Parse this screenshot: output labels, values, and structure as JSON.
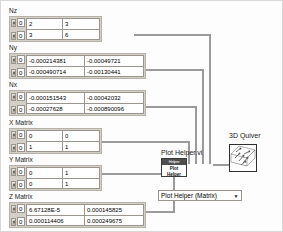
{
  "window": {
    "title": "LabVIEW Block Diagram"
  },
  "arrays": [
    {
      "label": "Nz",
      "indices": [
        "0",
        "0"
      ],
      "cell_class": "narrow",
      "rows": [
        [
          "2",
          "3"
        ],
        [
          "3",
          "6"
        ]
      ]
    },
    {
      "label": "Ny",
      "indices": [
        "0",
        "0"
      ],
      "cell_class": "wide",
      "rows": [
        [
          "-0.000214381",
          "-0.00049721"
        ],
        [
          "-0.000490714",
          "-0.00130441"
        ]
      ]
    },
    {
      "label": "Nx",
      "indices": [
        "0",
        "0"
      ],
      "cell_class": "wide",
      "rows": [
        [
          "-0.000151543",
          "-0.00042032"
        ],
        [
          "-0.00027628",
          "-0.000890096"
        ]
      ]
    },
    {
      "label": "X Matrix",
      "indices": [
        "0",
        "0"
      ],
      "cell_class": "narrow",
      "rows": [
        [
          "0",
          "0"
        ],
        [
          "1",
          "1"
        ]
      ]
    },
    {
      "label": "Y Matrix",
      "indices": [
        "0",
        "0"
      ],
      "cell_class": "narrow",
      "rows": [
        [
          "0",
          "1"
        ],
        [
          "0",
          "1"
        ]
      ]
    },
    {
      "label": "Z Matrix",
      "indices": [
        "0",
        "0"
      ],
      "cell_class": "wide",
      "rows": [
        [
          "6.67128E-5",
          "0.000145825"
        ],
        [
          "0.000114406",
          "0.000249675"
        ]
      ]
    }
  ],
  "nodes": {
    "plot_helper": {
      "label": "Plot Helper.vi",
      "icon_title": "Helper",
      "icon_line1": "Plot",
      "icon_line2": "Helper"
    },
    "quiver": {
      "label": "3D Quiver"
    }
  },
  "dropdown": {
    "value": "Plot Helper (Matrix)",
    "arrow": "▼"
  }
}
